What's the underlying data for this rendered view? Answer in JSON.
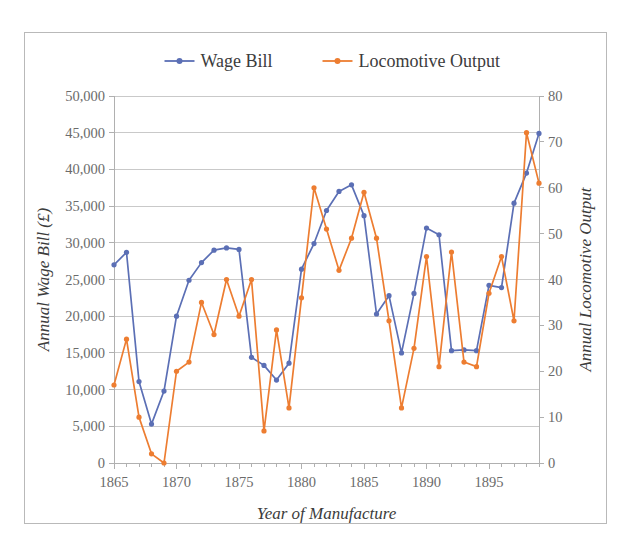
{
  "chart_data": {
    "type": "line",
    "title": "",
    "xlabel": "Year of Manufacture",
    "ylabel": "Annual Wage Bill (£)",
    "y2label": "Annual Locomotive Output",
    "grid": true,
    "legend_position": "top",
    "xlim": [
      1865,
      1899
    ],
    "xticks": [
      1865,
      1870,
      1875,
      1880,
      1885,
      1890,
      1895
    ],
    "xtick_labels": [
      "1865",
      "1870",
      "1875",
      "1880",
      "1885",
      "1890",
      "1895"
    ],
    "ylim": [
      0,
      50000
    ],
    "yticks": [
      0,
      5000,
      10000,
      15000,
      20000,
      25000,
      30000,
      35000,
      40000,
      45000,
      50000
    ],
    "ytick_labels": [
      "0",
      "5,000",
      "10,000",
      "15,000",
      "20,000",
      "25,000",
      "30,000",
      "35,000",
      "40,000",
      "45,000",
      "50,000"
    ],
    "y2lim": [
      0,
      80
    ],
    "y2ticks": [
      0,
      10,
      20,
      30,
      40,
      50,
      60,
      70,
      80
    ],
    "y2tick_labels": [
      "0",
      "10",
      "20",
      "30",
      "40",
      "50",
      "60",
      "70",
      "80"
    ],
    "x": [
      1865,
      1866,
      1867,
      1868,
      1869,
      1870,
      1871,
      1872,
      1873,
      1874,
      1875,
      1876,
      1877,
      1878,
      1879,
      1880,
      1881,
      1882,
      1883,
      1884,
      1885,
      1886,
      1887,
      1888,
      1889,
      1890,
      1891,
      1892,
      1893,
      1894,
      1895,
      1896,
      1897,
      1898,
      1899
    ],
    "series": [
      {
        "name": "Wage Bill",
        "color": "#5B6FB5",
        "axis": "left",
        "values": [
          27000,
          28700,
          11100,
          5300,
          9800,
          20000,
          24900,
          27300,
          29000,
          29300,
          29100,
          14400,
          13300,
          11300,
          13600,
          26400,
          29900,
          34400,
          37000,
          37900,
          33700,
          20300,
          22800,
          15000,
          23100,
          32000,
          31100,
          15300,
          15400,
          15300,
          24200,
          23900,
          35400,
          39500,
          44900
        ]
      },
      {
        "name": "Locomotive Output",
        "color": "#ED7D31",
        "axis": "right",
        "values": [
          17,
          27,
          10,
          2,
          0,
          20,
          22,
          35,
          28,
          40,
          32,
          40,
          7,
          29,
          12,
          36,
          60,
          51,
          42,
          49,
          59,
          49,
          31,
          12,
          25,
          45,
          21,
          46,
          22,
          21,
          37,
          45,
          31,
          72,
          61
        ]
      }
    ]
  },
  "legend": {
    "entries": [
      {
        "label": "Wage Bill",
        "color": "#5B6FB5"
      },
      {
        "label": "Locomotive Output",
        "color": "#ED7D31"
      }
    ]
  }
}
